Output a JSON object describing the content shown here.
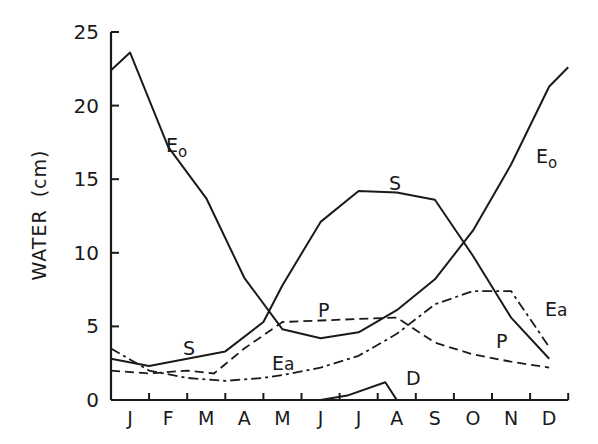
{
  "chart_data": {
    "type": "line",
    "title": "",
    "xlabel": "",
    "ylabel": "WATER (cm)",
    "ylim": [
      0,
      25
    ],
    "yticks": [
      0,
      5,
      10,
      15,
      20,
      25
    ],
    "ytick_labels": [
      "0",
      "5",
      "10",
      "15",
      "20",
      "25"
    ],
    "categories": [
      "J",
      "F",
      "M",
      "A",
      "M",
      "J",
      "J",
      "A",
      "S",
      "O",
      "N",
      "D"
    ],
    "grid": false,
    "legend": "inline curve labels",
    "x_positions": [
      0,
      0.5,
      1.5,
      2.5,
      3.5,
      4.5,
      5.5,
      6.5,
      7.5,
      8.5,
      9.5,
      10.5,
      11.5,
      12
    ],
    "series": [
      {
        "name": "Eo",
        "style": "solid",
        "points": [
          [
            0,
            22.4
          ],
          [
            0.5,
            23.6
          ],
          [
            1.5,
            17.2
          ],
          [
            2.5,
            13.7
          ],
          [
            3.5,
            8.3
          ],
          [
            4.5,
            4.8
          ],
          [
            5.5,
            4.2
          ],
          [
            6.5,
            4.6
          ],
          [
            7.5,
            6.1
          ],
          [
            8.5,
            8.2
          ],
          [
            9.5,
            11.5
          ],
          [
            10.5,
            16.0
          ],
          [
            11.5,
            21.3
          ],
          [
            12,
            22.6
          ]
        ]
      },
      {
        "name": "S",
        "style": "solid",
        "points": [
          [
            0,
            2.8
          ],
          [
            1,
            2.3
          ],
          [
            2,
            2.8
          ],
          [
            3,
            3.3
          ],
          [
            4,
            5.3
          ],
          [
            4.5,
            7.8
          ],
          [
            5.5,
            12.1
          ],
          [
            6.5,
            14.2
          ],
          [
            7.5,
            14.1
          ],
          [
            8.5,
            13.6
          ],
          [
            9.5,
            9.8
          ],
          [
            10.5,
            5.6
          ],
          [
            11.5,
            2.8
          ]
        ]
      },
      {
        "name": "P",
        "style": "dashed",
        "points": [
          [
            0,
            2.0
          ],
          [
            1,
            1.8
          ],
          [
            2,
            2.0
          ],
          [
            2.7,
            1.8
          ],
          [
            3.5,
            3.5
          ],
          [
            4.5,
            5.3
          ],
          [
            5.5,
            5.4
          ],
          [
            6.5,
            5.5
          ],
          [
            7.5,
            5.6
          ],
          [
            8.5,
            3.9
          ],
          [
            9.5,
            3.1
          ],
          [
            10.5,
            2.6
          ],
          [
            11.5,
            2.2
          ]
        ]
      },
      {
        "name": "Ea",
        "style": "dash-dot",
        "points": [
          [
            0,
            3.5
          ],
          [
            1,
            2.0
          ],
          [
            2,
            1.5
          ],
          [
            3,
            1.3
          ],
          [
            4,
            1.5
          ],
          [
            4.5,
            1.7
          ],
          [
            5.5,
            2.2
          ],
          [
            6.5,
            3.0
          ],
          [
            7.5,
            4.5
          ],
          [
            8.5,
            6.5
          ],
          [
            9.5,
            7.4
          ],
          [
            10.5,
            7.4
          ],
          [
            11.5,
            3.6
          ]
        ]
      },
      {
        "name": "D",
        "style": "solid",
        "points": [
          [
            5.5,
            0.0
          ],
          [
            6.2,
            0.3
          ],
          [
            7.2,
            1.2
          ],
          [
            7.5,
            0.0
          ]
        ]
      }
    ],
    "annotations": [
      {
        "text": "Eo",
        "near": "Eo curve, Feb (falling limb)"
      },
      {
        "text": "Eo",
        "near": "Eo curve, Nov (rising limb)"
      },
      {
        "text": "S",
        "near": "S curve, Feb-Mar"
      },
      {
        "text": "S",
        "near": "S curve peak, Aug"
      },
      {
        "text": "P",
        "near": "P curve, Jun"
      },
      {
        "text": "P",
        "near": "P curve, Oct-Nov"
      },
      {
        "text": "Ea",
        "near": "Ea curve, May"
      },
      {
        "text": "Ea",
        "near": "Ea curve, Dec"
      },
      {
        "text": "D",
        "near": "D curve, Aug"
      }
    ]
  },
  "axis": {
    "ylabel_main": "WATER",
    "ylabel_unit": "(cm)",
    "yticks": [
      "0",
      "5",
      "10",
      "15",
      "20",
      "25"
    ],
    "months": [
      "J",
      "F",
      "M",
      "A",
      "M",
      "J",
      "J",
      "A",
      "S",
      "O",
      "N",
      "D"
    ]
  },
  "labels": {
    "eo_left": {
      "main": "E",
      "sub": "o"
    },
    "eo_right": {
      "main": "E",
      "sub": "o"
    },
    "s_left": "S",
    "s_peak": "S",
    "p_left": "P",
    "p_right": "P",
    "ea_left": {
      "main": "E",
      "sub": "a"
    },
    "ea_right": {
      "main": "E",
      "sub": "a"
    },
    "d": "D"
  }
}
